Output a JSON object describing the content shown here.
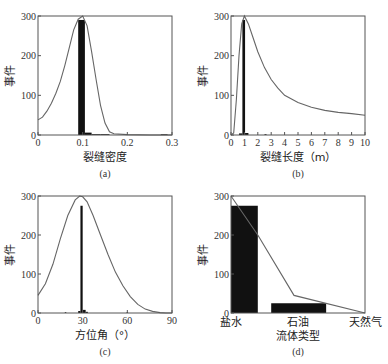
{
  "chart_data": [
    {
      "id": "a",
      "type": "bar",
      "caption": "(a)",
      "xlabel": "裂缝密度",
      "ylabel": "事件",
      "xlim": [
        0,
        0.3
      ],
      "ylim": [
        0,
        300
      ],
      "xticks": [
        "0",
        "0.1",
        "0.2",
        "0.3"
      ],
      "yticks": [
        "0",
        "100",
        "200",
        "300"
      ],
      "bars": [
        {
          "x0": 0.09,
          "x1": 0.105,
          "value": 290
        },
        {
          "x0": 0.105,
          "x1": 0.12,
          "value": 6
        },
        {
          "x0": 0.12,
          "x1": 0.14,
          "value": 2
        },
        {
          "x0": 0.14,
          "x1": 0.16,
          "value": 2
        },
        {
          "x0": 0.275,
          "x1": 0.29,
          "value": 2
        }
      ],
      "curve": {
        "x": [
          0,
          0.01,
          0.02,
          0.03,
          0.04,
          0.05,
          0.06,
          0.07,
          0.08,
          0.09,
          0.1,
          0.11,
          0.12,
          0.13,
          0.14,
          0.15,
          0.16,
          0.17,
          0.2,
          0.25,
          0.3
        ],
        "y": [
          38,
          45,
          60,
          80,
          105,
          135,
          175,
          220,
          265,
          292,
          300,
          275,
          210,
          140,
          75,
          30,
          8,
          3,
          1,
          0,
          0
        ]
      }
    },
    {
      "id": "b",
      "type": "bar",
      "caption": "(b)",
      "xlabel": "裂缝长度（m）",
      "ylabel": "事件",
      "xlim": [
        0,
        10
      ],
      "ylim": [
        0,
        300
      ],
      "xticks": [
        "0",
        "1",
        "2",
        "3",
        "4",
        "5",
        "6",
        "7",
        "8",
        "9",
        "10"
      ],
      "yticks": [
        "0",
        "100",
        "200",
        "300"
      ],
      "bars": [
        {
          "x0": 0.85,
          "x1": 1.05,
          "value": 290
        },
        {
          "x0": 0.6,
          "x1": 0.85,
          "value": 4
        },
        {
          "x0": 1.05,
          "x1": 1.3,
          "value": 5
        },
        {
          "x0": 2.5,
          "x1": 2.65,
          "value": 2
        }
      ],
      "curve": {
        "x": [
          0,
          0.2,
          0.4,
          0.6,
          0.8,
          1.0,
          1.3,
          1.6,
          2,
          2.5,
          3,
          3.5,
          4,
          5,
          6,
          7,
          8,
          9,
          10
        ],
        "y": [
          0,
          5,
          90,
          200,
          280,
          300,
          280,
          250,
          210,
          170,
          140,
          118,
          100,
          82,
          70,
          62,
          57,
          54,
          50
        ]
      }
    },
    {
      "id": "c",
      "type": "bar",
      "caption": "(c)",
      "xlabel": "方位角（°）",
      "ylabel": "事件",
      "xlim": [
        0,
        90
      ],
      "ylim": [
        0,
        300
      ],
      "xticks": [
        "0",
        "30",
        "60",
        "90"
      ],
      "yticks": [
        "0",
        "100",
        "200",
        "300"
      ],
      "bars": [
        {
          "x0": 28.5,
          "x1": 30,
          "value": 275
        },
        {
          "x0": 27,
          "x1": 28.5,
          "value": 5
        },
        {
          "x0": 30,
          "x1": 32,
          "value": 8
        },
        {
          "x0": 32,
          "x1": 33.5,
          "value": 3
        },
        {
          "x0": 18,
          "x1": 19,
          "value": 2
        },
        {
          "x0": 59.5,
          "x1": 60.5,
          "value": 2
        }
      ],
      "curve": {
        "x": [
          0,
          5,
          10,
          15,
          20,
          25,
          28,
          30,
          33,
          37,
          42,
          47,
          52,
          57,
          62,
          67,
          72,
          77,
          82,
          86,
          90
        ],
        "y": [
          45,
          75,
          125,
          190,
          250,
          290,
          300,
          298,
          285,
          250,
          200,
          150,
          105,
          70,
          42,
          22,
          10,
          4,
          1,
          0,
          0
        ]
      }
    },
    {
      "id": "d",
      "type": "bar",
      "caption": "(d)",
      "xlabel": "流体类型",
      "ylabel": "事件",
      "ylim": [
        0,
        300
      ],
      "yticks": [
        "0",
        "100",
        "200",
        "300"
      ],
      "categories": [
        "盐水",
        "石油",
        "天然气"
      ],
      "values": [
        275,
        25,
        0
      ],
      "line": {
        "categories": [
          "盐水",
          "石油",
          "天然气"
        ],
        "points": [
          [
            0,
            300
          ],
          [
            0.2,
            200
          ],
          [
            0.47,
            45
          ],
          [
            1.0,
            0
          ]
        ]
      }
    }
  ],
  "colors": {
    "bar": "#111111",
    "curve": "#666666",
    "frame": "#555555"
  }
}
